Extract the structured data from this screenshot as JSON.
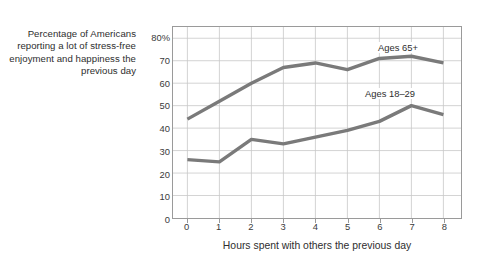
{
  "figure": {
    "background_color": "#ffffff",
    "frame_color": "#9a9a9a",
    "grid_color": "#c8c8c8",
    "line_color": "#7a7a7a"
  },
  "ylabel_text": "Percentage of Americans reporting a lot of stress-free enjoyment and happiness the previous day",
  "chart_data": {
    "type": "line",
    "title": "",
    "subtitle": "",
    "xlabel": "Hours spent with others the previous day",
    "ylabel": "Percentage of Americans reporting a lot of stress-free enjoyment and happiness the previous day",
    "x": [
      0,
      1,
      2,
      3,
      4,
      5,
      6,
      7,
      8
    ],
    "categories": [
      "0",
      "1",
      "2",
      "3",
      "4",
      "5",
      "6",
      "7",
      "8"
    ],
    "xlim": [
      -0.45,
      8.55
    ],
    "ylim": [
      0,
      85
    ],
    "yticks": [
      0,
      10,
      20,
      30,
      40,
      50,
      60,
      70,
      80
    ],
    "ytick_labels": [
      "0",
      "10",
      "20",
      "30",
      "40",
      "50",
      "60",
      "70",
      "80%"
    ],
    "xticks": [
      0,
      1,
      2,
      3,
      4,
      5,
      6,
      7,
      8
    ],
    "xtick_labels": [
      "0",
      "1",
      "2",
      "3",
      "4",
      "5",
      "6",
      "7",
      "8"
    ],
    "grid": true,
    "legend_position": "inline-annotations",
    "series": [
      {
        "name": "Ages 65+",
        "color": "#7a7a7a",
        "values": [
          44,
          52,
          60,
          67,
          69,
          66,
          71,
          72,
          69
        ]
      },
      {
        "name": "Ages 18–29",
        "color": "#7a7a7a",
        "values": [
          26,
          25,
          35,
          33,
          36,
          39,
          43,
          50,
          46
        ]
      }
    ],
    "annotations": [
      {
        "text": "Ages 65+",
        "x": 6,
        "y": 76
      },
      {
        "text": "Ages 18–29",
        "x": 6,
        "y": 56
      }
    ]
  }
}
